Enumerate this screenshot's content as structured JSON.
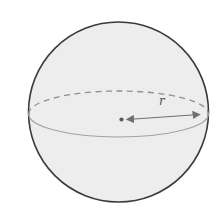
{
  "diagram": {
    "name": "sphere-with-radius",
    "radius_label": "r",
    "colors": {
      "background": "#ffffff",
      "sphere_fill": "#ededed",
      "sphere_outline": "#3b3b3b",
      "equator_back": "#8f8f8f",
      "equator_front": "#a3a3a3",
      "radius_arrow": "#6f6f6f",
      "center_dot": "#5a5a5a",
      "label": "#4d4d4d"
    }
  }
}
